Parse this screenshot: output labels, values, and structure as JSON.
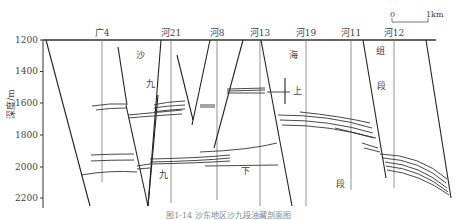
{
  "figure": {
    "type": "geological cross-section",
    "y_axis": {
      "label": "深度/m",
      "ticks": [
        "1200",
        "1400",
        "1600",
        "1800",
        "2000",
        "2200"
      ],
      "range": [
        1200,
        2280
      ]
    },
    "scale_bar": {
      "start": "0",
      "end": "1km"
    },
    "wells": [
      {
        "name": "广4",
        "x": 102
      },
      {
        "name": "河21",
        "x": 171
      },
      {
        "name": "河8",
        "x": 217
      },
      {
        "name": "河13",
        "x": 260
      },
      {
        "name": "河19",
        "x": 306
      },
      {
        "name": "河11",
        "x": 351
      },
      {
        "name": "河12",
        "x": 394
      }
    ],
    "strata_labels": [
      {
        "text": "沙",
        "x": 140,
        "y": 58
      },
      {
        "text": "九",
        "x": 150,
        "y": 87
      },
      {
        "text": "海",
        "x": 293,
        "y": 58
      },
      {
        "text": "上",
        "x": 297,
        "y": 94
      },
      {
        "text": "组",
        "x": 380,
        "y": 54
      },
      {
        "text": "段",
        "x": 381,
        "y": 89
      },
      {
        "text": "九",
        "x": 163,
        "y": 178
      },
      {
        "text": "下",
        "x": 245,
        "y": 174
      },
      {
        "text": "段",
        "x": 340,
        "y": 187
      }
    ],
    "caption": "图1-14  沙东地区沙九段油藏剖面图"
  }
}
